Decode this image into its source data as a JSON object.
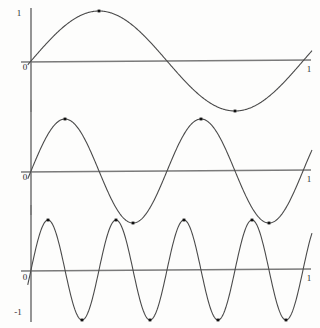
{
  "figure": {
    "title": "",
    "background_color": "#fdfdfc",
    "axis_color": "#7a7a7a",
    "curve_color": "#4a4a4a",
    "marker_color": "#111111",
    "label_color": "#2a2a2a"
  },
  "chart_data": [
    {
      "type": "line",
      "name": "sine-1-period",
      "title": "",
      "xlabel": "",
      "ylabel": "",
      "xlim": [
        0,
        1
      ],
      "ylim": [
        -1,
        1
      ],
      "grid": false,
      "legend": null,
      "x_tick_labels": [
        "0",
        "1"
      ],
      "y_tick_labels": [
        "1"
      ],
      "periods": 1,
      "amplitude": 1,
      "function": "sin(2*pi*x)",
      "markers": [
        {
          "x": 0.25,
          "y": 1
        },
        {
          "x": 0.75,
          "y": -1
        }
      ],
      "x": [
        0,
        0.05,
        0.1,
        0.15,
        0.2,
        0.25,
        0.3,
        0.35,
        0.4,
        0.45,
        0.5,
        0.55,
        0.6,
        0.65,
        0.7,
        0.75,
        0.8,
        0.85,
        0.9,
        0.95,
        1
      ],
      "values": [
        0,
        0.309,
        0.588,
        0.809,
        0.951,
        1,
        0.951,
        0.809,
        0.588,
        0.309,
        0,
        -0.309,
        -0.588,
        -0.809,
        -0.951,
        -1,
        -0.951,
        -0.809,
        -0.588,
        -0.309,
        0
      ]
    },
    {
      "type": "line",
      "name": "sine-2-periods",
      "title": "",
      "xlabel": "",
      "ylabel": "",
      "xlim": [
        0,
        1
      ],
      "ylim": [
        -1,
        1
      ],
      "grid": false,
      "legend": null,
      "x_tick_labels": [
        "0",
        "1"
      ],
      "y_tick_labels": [],
      "periods": 2,
      "amplitude": 1,
      "function": "sin(4*pi*x)",
      "markers": [
        {
          "x": 0.125,
          "y": 1
        },
        {
          "x": 0.375,
          "y": -1
        },
        {
          "x": 0.625,
          "y": 1
        },
        {
          "x": 0.875,
          "y": -1
        }
      ],
      "x": [
        0,
        0.05,
        0.1,
        0.15,
        0.2,
        0.25,
        0.3,
        0.35,
        0.4,
        0.45,
        0.5,
        0.55,
        0.6,
        0.65,
        0.7,
        0.75,
        0.8,
        0.85,
        0.9,
        0.95,
        1
      ],
      "values": [
        0,
        0.588,
        0.951,
        0.951,
        0.588,
        0,
        -0.588,
        -0.951,
        -0.951,
        -0.588,
        0,
        0.588,
        0.951,
        0.951,
        0.588,
        0,
        -0.588,
        -0.951,
        -0.951,
        -0.588,
        0
      ]
    },
    {
      "type": "line",
      "name": "sine-4-periods",
      "title": "",
      "xlabel": "",
      "ylabel": "",
      "xlim": [
        0,
        1
      ],
      "ylim": [
        -1,
        1
      ],
      "grid": false,
      "legend": null,
      "x_tick_labels": [
        "0",
        "1"
      ],
      "y_tick_labels": [
        "-1"
      ],
      "periods": 4,
      "amplitude": 1,
      "function": "sin(8*pi*x)",
      "markers": [
        {
          "x": 0.0625,
          "y": 1
        },
        {
          "x": 0.1875,
          "y": -1
        },
        {
          "x": 0.3125,
          "y": 1
        },
        {
          "x": 0.4375,
          "y": -1
        },
        {
          "x": 0.5625,
          "y": 1
        },
        {
          "x": 0.6875,
          "y": -1
        },
        {
          "x": 0.8125,
          "y": 1
        },
        {
          "x": 0.9375,
          "y": -1
        }
      ],
      "x": [
        0,
        0.05,
        0.1,
        0.15,
        0.2,
        0.25,
        0.3,
        0.35,
        0.4,
        0.45,
        0.5,
        0.55,
        0.6,
        0.65,
        0.7,
        0.75,
        0.8,
        0.85,
        0.9,
        0.95,
        1
      ],
      "values": [
        0,
        0.951,
        0.588,
        -0.588,
        -0.951,
        0,
        0.951,
        0.588,
        -0.588,
        -0.951,
        0,
        0.951,
        0.588,
        -0.588,
        -0.951,
        0,
        0.951,
        0.588,
        -0.588,
        -0.951,
        0
      ]
    }
  ],
  "panels": [
    {
      "id": "panel-1",
      "y_top_label": "1",
      "origin_label": "0",
      "x_end_label": "1"
    },
    {
      "id": "panel-2",
      "y_top_label": "",
      "origin_label": "0",
      "x_end_label": "1"
    },
    {
      "id": "panel-3",
      "y_top_label": "",
      "origin_label": "0",
      "x_end_label": "1",
      "y_bottom_label": "-1"
    }
  ]
}
